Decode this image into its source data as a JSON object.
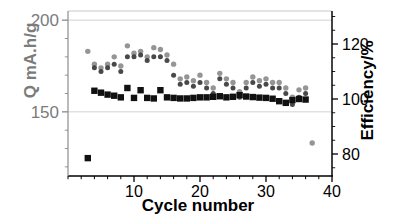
{
  "chart_data": {
    "type": "scatter",
    "title": "",
    "xlabel": "Cycle number",
    "ylabel": "Q mA.h/g",
    "ylabel_right": "Efficiency/%",
    "xlim": [
      0,
      40
    ],
    "xticks": [
      10,
      20,
      30,
      40
    ],
    "xtick_labels": [
      "10",
      "20",
      "30",
      "40"
    ],
    "xminor_tick_interval": 2,
    "ylim_left": [
      115,
      205
    ],
    "yticks_left": [
      150,
      200
    ],
    "ytick_labels_left": [
      "150",
      "200"
    ],
    "ylim_right": [
      72,
      132
    ],
    "yticks_right": [
      80,
      100,
      120
    ],
    "ytick_labels_right": [
      "80",
      "100",
      "120"
    ],
    "grid": true,
    "grid_color": "#c8c8c8",
    "legend": "none",
    "left_axis_color": "#7b7b7b",
    "right_axis_color": "#000000",
    "series": [
      {
        "name": "Discharge capacity",
        "axis": "left",
        "marker": "circle",
        "color": "#8c8c8c",
        "size": 5.4,
        "x": [
          3,
          4,
          5,
          6,
          7,
          8,
          9,
          10,
          11,
          12,
          13,
          14,
          15,
          16,
          17,
          18,
          19,
          20,
          21,
          22,
          23,
          24,
          25,
          26,
          27,
          28,
          29,
          30,
          31,
          32,
          33,
          34,
          35,
          36,
          37
        ],
        "y": [
          183,
          176,
          174,
          176,
          180,
          175,
          186,
          182,
          183,
          180,
          185,
          184,
          181,
          176,
          168,
          169,
          167,
          170,
          166,
          163,
          171,
          168,
          166,
          161,
          166,
          169,
          167,
          168,
          166,
          166,
          163,
          158,
          162,
          163,
          133
        ]
      },
      {
        "name": "Charge capacity",
        "axis": "left",
        "marker": "circle",
        "color": "#3a3a3a",
        "size": 5.0,
        "x": [
          4,
          5,
          6,
          7,
          8,
          9,
          10,
          11,
          12,
          13,
          14,
          15,
          16,
          17,
          18,
          19,
          20,
          21,
          22,
          23,
          24,
          25,
          26,
          27,
          28,
          29,
          30,
          31,
          32,
          33,
          34,
          35,
          36
        ],
        "y": [
          174,
          172,
          174,
          176,
          172,
          180,
          180,
          181,
          178,
          180,
          180,
          178,
          170,
          165,
          166,
          164,
          166,
          163,
          160,
          168,
          165,
          163,
          158,
          163,
          166,
          164,
          165,
          163,
          163,
          160,
          154,
          158,
          160
        ]
      },
      {
        "name": "Coulombic efficiency",
        "axis": "right",
        "marker": "square",
        "color": "#111111",
        "size": 5.2,
        "x": [
          3,
          4,
          5,
          6,
          7,
          8,
          9,
          10,
          11,
          12,
          13,
          14,
          15,
          16,
          17,
          18,
          19,
          20,
          21,
          22,
          23,
          24,
          25,
          26,
          27,
          28,
          29,
          30,
          31,
          32,
          33,
          34,
          35,
          36
        ],
        "y": [
          78.5,
          103.0,
          102.3,
          101.6,
          101.2,
          100.6,
          104.0,
          100.4,
          103.2,
          100.4,
          100.2,
          103.2,
          100.6,
          100.4,
          100.2,
          100.2,
          100.4,
          100.6,
          100.6,
          100.8,
          101.0,
          100.6,
          100.8,
          101.4,
          100.9,
          100.7,
          100.5,
          100.4,
          100.1,
          99.2,
          98.6,
          99.6,
          100.0,
          99.8
        ]
      }
    ]
  },
  "labels": {
    "xlabel": "Cycle number",
    "ylabel_left": "Q mA.h/g",
    "ylabel_right": "Efficiency/%"
  }
}
